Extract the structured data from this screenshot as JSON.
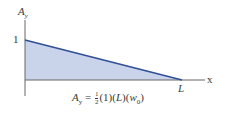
{
  "diagram": {
    "y_axis_label": "A",
    "y_axis_label_sub": "y",
    "y_tick_label": "1",
    "x_axis_label": "x",
    "x_end_label": "L",
    "formula": {
      "lhs": "A",
      "lhs_sub": "y",
      "equals": "=",
      "frac_num": "1",
      "frac_den": "2",
      "term1": "(1)",
      "term2_open": "(",
      "term2_var": "L",
      "term2_close": ")",
      "term3_open": "(",
      "term3_var": "w",
      "term3_sub": "0",
      "term3_close": ")"
    },
    "colors": {
      "fill": "#c9d3ea",
      "line": "#2f4f9a",
      "axis": "#555555"
    }
  }
}
